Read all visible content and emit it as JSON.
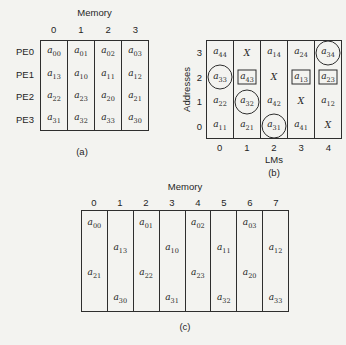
{
  "colors": {
    "background": "#f3f3f0",
    "line": "#2e2e2e",
    "text": "#1f1f1f"
  },
  "figure": {
    "panel_a": {
      "title": "Memory",
      "caption": "(a)",
      "column_labels": [
        "0",
        "1",
        "2",
        "3"
      ],
      "row_labels": [
        "PE0",
        "PE1",
        "PE2",
        "PE3"
      ],
      "rows": [
        [
          "a00",
          "a01",
          "a02",
          "a03"
        ],
        [
          "a13",
          "a10",
          "a11",
          "a12"
        ],
        [
          "a22",
          "a23",
          "a20",
          "a21"
        ],
        [
          "a31",
          "a32",
          "a33",
          "a30"
        ]
      ]
    },
    "panel_b": {
      "caption": "(b)",
      "y_axis_label": "Addresses",
      "x_axis_label": "LMs",
      "row_labels": [
        "3",
        "2",
        "1",
        "0"
      ],
      "column_labels": [
        "0",
        "1",
        "2",
        "3",
        "4"
      ],
      "rows": [
        [
          {
            "v": "a44"
          },
          {
            "v": "X"
          },
          {
            "v": "a14"
          },
          {
            "v": "a24"
          },
          {
            "v": "a34",
            "mark": "circle"
          }
        ],
        [
          {
            "v": "a33",
            "mark": "circle"
          },
          {
            "v": "a43",
            "mark": "box"
          },
          {
            "v": "X"
          },
          {
            "v": "a13",
            "mark": "box"
          },
          {
            "v": "a23",
            "mark": "box"
          }
        ],
        [
          {
            "v": "a22"
          },
          {
            "v": "a32",
            "mark": "circle"
          },
          {
            "v": "a42"
          },
          {
            "v": "X"
          },
          {
            "v": "a12"
          }
        ],
        [
          {
            "v": "a11"
          },
          {
            "v": "a21"
          },
          {
            "v": "a31",
            "mark": "circle"
          },
          {
            "v": "a41"
          },
          {
            "v": "X"
          }
        ]
      ]
    },
    "panel_c": {
      "title": "Memory",
      "caption": "(c)",
      "column_labels": [
        "0",
        "1",
        "2",
        "3",
        "4",
        "5",
        "6",
        "7"
      ],
      "columns": [
        {
          "cells": [
            "a00",
            "",
            "a21",
            ""
          ]
        },
        {
          "cells": [
            "",
            "a13",
            "",
            "a30"
          ]
        },
        {
          "cells": [
            "a01",
            "",
            "a22",
            ""
          ]
        },
        {
          "cells": [
            "",
            "a10",
            "",
            "a31"
          ]
        },
        {
          "cells": [
            "a02",
            "",
            "a23",
            ""
          ]
        },
        {
          "cells": [
            "",
            "a11",
            "",
            "a32"
          ]
        },
        {
          "cells": [
            "a03",
            "",
            "a20",
            ""
          ]
        },
        {
          "cells": [
            "",
            "a12",
            "",
            "a33"
          ]
        }
      ]
    }
  }
}
